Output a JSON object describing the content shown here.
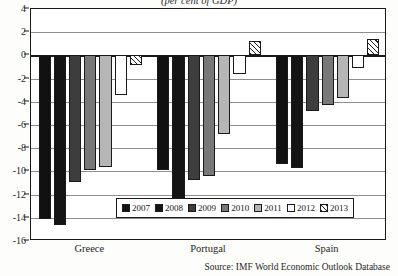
{
  "chart_data": {
    "type": "bar",
    "title": "(per cent of GDP)",
    "xlabel": "",
    "ylabel": "",
    "ylim": [
      -16,
      4
    ],
    "ytick_step": 2,
    "yticks": [
      4,
      2,
      0,
      -2,
      -4,
      -6,
      -8,
      -10,
      -12,
      -14,
      -16
    ],
    "grid": true,
    "legend_position": "inside-bottom-center",
    "categories": [
      "Greece",
      "Portugal",
      "Spain"
    ],
    "series": [
      {
        "name": "2007",
        "values": [
          -14.1,
          -9.9,
          -9.4
        ]
      },
      {
        "name": "2008",
        "values": [
          -14.6,
          -12.8,
          -9.7
        ]
      },
      {
        "name": "2009",
        "values": [
          -10.9,
          -10.7,
          -4.8
        ]
      },
      {
        "name": "2010",
        "values": [
          -9.9,
          -10.4,
          -4.3
        ]
      },
      {
        "name": "2011",
        "values": [
          -9.6,
          -6.8,
          -3.7
        ]
      },
      {
        "name": "2012",
        "values": [
          -3.4,
          -1.6,
          -1.1
        ]
      },
      {
        "name": "2013",
        "values": [
          -0.8,
          1.2,
          1.4
        ]
      }
    ],
    "source": "Source: IMF World Economic Outlook Database"
  },
  "legend": {
    "items": [
      {
        "label": "2007",
        "swatch": "sw-2007"
      },
      {
        "label": "2008",
        "swatch": "sw-2008"
      },
      {
        "label": "2009",
        "swatch": "sw-2009"
      },
      {
        "label": "2010",
        "swatch": "sw-2010"
      },
      {
        "label": "2011",
        "swatch": "sw-2011"
      },
      {
        "label": "2012",
        "swatch": "sw-2012"
      },
      {
        "label": "2013",
        "swatch": "sw-2013"
      }
    ]
  },
  "colors": {
    "axis": "#1a1a1a",
    "grid": "#8e8e8e",
    "plot_background": "#ffffff",
    "page_background": "#fdfdfb",
    "s2007": "#111111",
    "s2008": "#141414",
    "s2009": "#3d3d3d",
    "s2010": "#787878",
    "s2011": "#b6b6b6",
    "s2012": "#ffffff",
    "s2013": "#ffffff"
  }
}
